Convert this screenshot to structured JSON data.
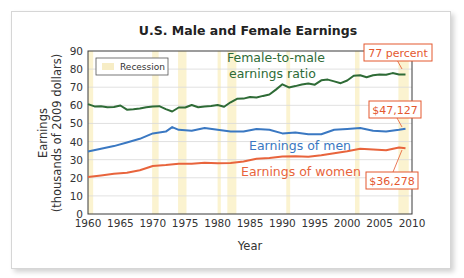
{
  "chart_data": {
    "type": "line",
    "title": "U.S. Male and Female Earnings",
    "xlabel": "Year",
    "ylabel": "Earnings",
    "ylabel_sub": "(thousands of 2009 dollars)",
    "xlim": [
      1960,
      2010
    ],
    "ylim": [
      0,
      90
    ],
    "x_ticks": [
      "1960",
      "1965",
      "1970",
      "1975",
      "1980",
      "1985",
      "1990",
      "1995",
      "2000",
      "2005",
      "2010"
    ],
    "y_ticks": [
      "0",
      "10",
      "20",
      "30",
      "40",
      "50",
      "60",
      "70",
      "80",
      "90"
    ],
    "grid": "horizontal",
    "legend": {
      "position": "upper-left",
      "entries": [
        "Recession"
      ]
    },
    "recessions": [
      [
        1960.0,
        1960.8
      ],
      [
        1969.9,
        1970.9
      ],
      [
        1973.9,
        1975.2
      ],
      [
        1980.0,
        1980.5
      ],
      [
        1981.5,
        1982.9
      ],
      [
        1990.6,
        1991.2
      ],
      [
        2001.2,
        2001.9
      ],
      [
        2007.9,
        2009.5
      ]
    ],
    "series": [
      {
        "name": "Female-to-male earnings ratio",
        "color": "#2e6b36",
        "x": [
          1960,
          1961,
          1962,
          1963,
          1964,
          1965,
          1966,
          1967,
          1968,
          1969,
          1970,
          1971,
          1972,
          1973,
          1974,
          1975,
          1976,
          1977,
          1978,
          1979,
          1980,
          1981,
          1982,
          1983,
          1984,
          1985,
          1986,
          1987,
          1988,
          1989,
          1990,
          1991,
          1992,
          1993,
          1994,
          1995,
          1996,
          1997,
          1998,
          1999,
          2000,
          2001,
          2002,
          2003,
          2004,
          2005,
          2006,
          2007,
          2008,
          2009
        ],
        "values": [
          60.7,
          59.4,
          59.5,
          58.9,
          59.1,
          59.9,
          57.6,
          57.8,
          58.2,
          58.9,
          59.4,
          59.5,
          57.9,
          56.6,
          58.8,
          58.8,
          60.2,
          58.9,
          59.4,
          59.7,
          60.2,
          59.2,
          61.7,
          63.6,
          63.7,
          64.6,
          64.3,
          65.2,
          66.0,
          68.7,
          71.6,
          69.9,
          70.6,
          71.5,
          72.0,
          71.4,
          73.8,
          74.2,
          73.2,
          72.2,
          73.7,
          76.3,
          76.6,
          75.5,
          76.6,
          77.0,
          76.9,
          77.8,
          77.1,
          77.0
        ]
      },
      {
        "name": "Earnings of men",
        "color": "#3a78c2",
        "x": [
          1960,
          1962,
          1964,
          1966,
          1968,
          1970,
          1972,
          1973,
          1974,
          1976,
          1978,
          1980,
          1982,
          1984,
          1986,
          1988,
          1990,
          1992,
          1994,
          1996,
          1998,
          2000,
          2002,
          2004,
          2006,
          2008,
          2009
        ],
        "values": [
          34.5,
          36.0,
          37.5,
          39.5,
          41.5,
          44.5,
          45.5,
          48.0,
          46.5,
          46.0,
          47.5,
          46.5,
          45.5,
          45.5,
          47.0,
          46.5,
          44.5,
          45.0,
          44.0,
          44.0,
          46.5,
          47.0,
          47.5,
          46.0,
          45.5,
          46.5,
          47.1
        ]
      },
      {
        "name": "Earnings of women",
        "color": "#e8643c",
        "x": [
          1960,
          1962,
          1964,
          1966,
          1968,
          1970,
          1972,
          1974,
          1976,
          1978,
          1980,
          1982,
          1984,
          1986,
          1988,
          1990,
          1992,
          1994,
          1996,
          1998,
          2000,
          2002,
          2004,
          2006,
          2008,
          2009
        ],
        "values": [
          20.5,
          21.3,
          22.2,
          22.8,
          24.2,
          26.5,
          27.0,
          27.7,
          27.8,
          28.3,
          28.0,
          28.2,
          29.0,
          30.5,
          31.0,
          31.8,
          31.9,
          31.6,
          32.4,
          33.5,
          34.7,
          36.0,
          35.6,
          35.2,
          36.7,
          36.3
        ]
      }
    ],
    "annotations": [
      {
        "text": "77 percent",
        "series": "Female-to-male earnings ratio",
        "x": 2009
      },
      {
        "text": "$47,127",
        "series": "Earnings of men",
        "x": 2009
      },
      {
        "text": "$36,278",
        "series": "Earnings of women",
        "x": 2009
      }
    ]
  },
  "labels": {
    "title": "U.S. Male and Female Earnings",
    "ylabel": "Earnings",
    "ylabel_sub": "(thousands of 2009 dollars)",
    "xlabel": "Year",
    "legend_recession": "Recession",
    "ratio_line1": "Female-to-male",
    "ratio_line2": "earnings ratio",
    "men": "Earnings of men",
    "women": "Earnings of women",
    "callout_ratio": "77 percent",
    "callout_men": "$47,127",
    "callout_women": "$36,278"
  },
  "colors": {
    "ratio": "#2e6b36",
    "men": "#3a78c2",
    "women": "#e8643c",
    "recession": "#fbf3d0",
    "callout_border": "#e4582f",
    "grid": "#d9d9d9"
  }
}
